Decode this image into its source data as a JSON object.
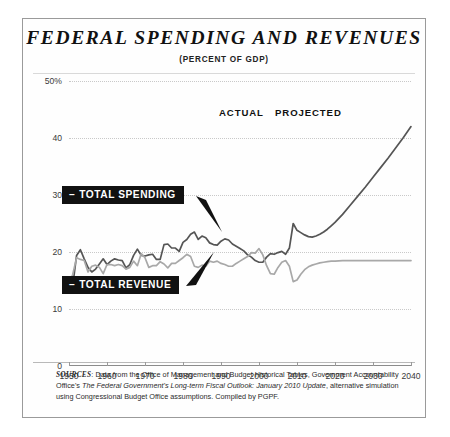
{
  "chart_data": {
    "type": "line",
    "title": "FEDERAL SPENDING AND REVENUES",
    "subtitle": "(PERCENT OF GDP)",
    "xlabel": "",
    "ylabel": "",
    "xlim": [
      1950,
      2040
    ],
    "ylim": [
      0,
      50
    ],
    "grid": true,
    "legend_position": "inline-callout",
    "x_ticks": [
      "1950",
      "1960",
      "1970",
      "1980",
      "1990",
      "2000",
      "2010",
      "2020",
      "2030",
      "2040"
    ],
    "y_ticks": [
      "0",
      "10",
      "20",
      "30",
      "40",
      "50%"
    ],
    "annotations": [
      {
        "text": "ACTUAL",
        "x": 1995
      },
      {
        "text": "PROJECTED",
        "x": 2011
      }
    ],
    "series": [
      {
        "name": "TOTAL SPENDING",
        "color": "#555555",
        "x": [
          1950,
          1951,
          1952,
          1953,
          1954,
          1955,
          1956,
          1957,
          1958,
          1959,
          1960,
          1961,
          1962,
          1963,
          1964,
          1965,
          1966,
          1967,
          1968,
          1969,
          1970,
          1971,
          1972,
          1973,
          1974,
          1975,
          1976,
          1977,
          1978,
          1979,
          1980,
          1981,
          1982,
          1983,
          1984,
          1985,
          1986,
          1987,
          1988,
          1989,
          1990,
          1991,
          1992,
          1993,
          1994,
          1995,
          1996,
          1997,
          1998,
          1999,
          2000,
          2001,
          2002,
          2003,
          2004,
          2005,
          2006,
          2007,
          2008,
          2009,
          2010,
          2011,
          2012,
          2013,
          2014,
          2015,
          2016,
          2017,
          2018,
          2019,
          2020,
          2022,
          2024,
          2026,
          2028,
          2030,
          2032,
          2034,
          2036,
          2038,
          2040
        ],
        "values": [
          15.6,
          14.2,
          19.4,
          20.4,
          18.8,
          17.3,
          16.5,
          17.0,
          17.9,
          18.8,
          17.8,
          18.4,
          18.8,
          18.6,
          18.5,
          17.2,
          17.8,
          19.4,
          20.5,
          19.4,
          19.3,
          19.5,
          19.6,
          18.7,
          18.7,
          21.3,
          21.4,
          20.7,
          20.7,
          20.1,
          21.7,
          22.2,
          23.1,
          23.5,
          22.2,
          22.8,
          22.5,
          21.6,
          21.3,
          21.2,
          21.9,
          22.3,
          22.1,
          21.4,
          21.0,
          20.6,
          20.2,
          19.5,
          19.1,
          18.5,
          18.2,
          18.2,
          19.1,
          19.7,
          19.6,
          19.9,
          20.1,
          19.6,
          20.7,
          25.0,
          23.8,
          23.4,
          23.0,
          22.7,
          22.6,
          22.8,
          23.1,
          23.5,
          24.0,
          24.6,
          25.2,
          26.6,
          28.2,
          29.8,
          31.4,
          33.1,
          34.8,
          36.5,
          38.3,
          40.1,
          42.0
        ]
      },
      {
        "name": "TOTAL REVENUE",
        "color": "#a8a8a8",
        "x": [
          1950,
          1951,
          1952,
          1953,
          1954,
          1955,
          1956,
          1957,
          1958,
          1959,
          1960,
          1961,
          1962,
          1963,
          1964,
          1965,
          1966,
          1967,
          1968,
          1969,
          1970,
          1971,
          1972,
          1973,
          1974,
          1975,
          1976,
          1977,
          1978,
          1979,
          1980,
          1981,
          1982,
          1983,
          1984,
          1985,
          1986,
          1987,
          1988,
          1989,
          1990,
          1991,
          1992,
          1993,
          1994,
          1995,
          1996,
          1997,
          1998,
          1999,
          2000,
          2001,
          2002,
          2003,
          2004,
          2005,
          2006,
          2007,
          2008,
          2009,
          2010,
          2011,
          2012,
          2013,
          2014,
          2015,
          2016,
          2017,
          2018,
          2019,
          2020,
          2022,
          2024,
          2026,
          2028,
          2030,
          2032,
          2034,
          2036,
          2038,
          2040
        ],
        "values": [
          14.4,
          16.1,
          19.0,
          18.7,
          18.5,
          16.5,
          17.5,
          17.7,
          17.3,
          16.2,
          17.8,
          17.8,
          17.6,
          17.8,
          17.6,
          17.0,
          17.3,
          18.4,
          17.6,
          19.7,
          19.0,
          17.3,
          17.6,
          17.6,
          18.3,
          17.9,
          17.2,
          18.0,
          18.0,
          18.5,
          19.0,
          19.6,
          19.2,
          17.5,
          17.3,
          17.7,
          17.5,
          18.4,
          18.2,
          18.4,
          18.0,
          17.8,
          17.5,
          17.5,
          18.0,
          18.4,
          18.8,
          19.2,
          19.9,
          19.8,
          20.6,
          19.5,
          17.6,
          16.2,
          16.1,
          17.3,
          18.2,
          18.5,
          17.5,
          14.8,
          15.1,
          16.1,
          16.9,
          17.4,
          17.7,
          17.9,
          18.1,
          18.2,
          18.3,
          18.4,
          18.4,
          18.5,
          18.5,
          18.5,
          18.5,
          18.5,
          18.5,
          18.5,
          18.5,
          18.5,
          18.5
        ]
      }
    ]
  },
  "callouts": {
    "spending": {
      "dash": "–",
      "label": "TOTAL SPENDING"
    },
    "revenue": {
      "dash": "–",
      "label": "TOTAL REVENUE"
    }
  },
  "sources": {
    "label": "SOURCES",
    "colon": ": ",
    "part1": "Data from the Office of Management and Budget Historical Tables, Government Accountability Office's ",
    "italic": "The Federal Government's Long-term Fiscal Outlook: January 2010 Update",
    "part2": ", alternative simulation using Congressional Budget Office assumptions. Compiled by PGPF."
  }
}
